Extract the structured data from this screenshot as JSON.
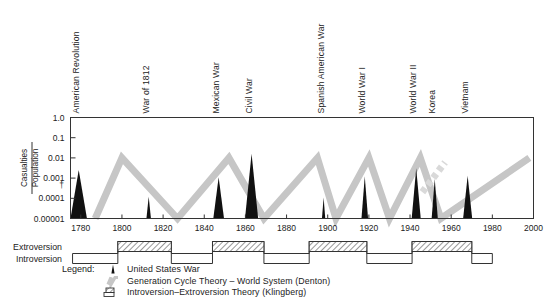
{
  "chart_data": {
    "type": "line",
    "title": "",
    "xlabel": "",
    "ylabel": "Casualties / Population",
    "ylabel_numerator": "Casualties",
    "ylabel_denominator": "Population",
    "xlim": [
      1775,
      2000
    ],
    "ylim": [
      1e-05,
      1.0
    ],
    "yscale": "log",
    "grid": false,
    "legend_position": "below-axes",
    "x_ticks": [
      1780,
      1800,
      1820,
      1840,
      1860,
      1880,
      1900,
      1920,
      1940,
      1960,
      1980,
      2000
    ],
    "x_tick_labels": [
      "1780",
      "1800",
      "1820",
      "1840",
      "1860",
      "1880",
      "1900",
      "1920",
      "1940",
      "1960",
      "1980",
      "2000"
    ],
    "y_ticks": [
      1.0,
      0.1,
      0.01,
      0.001,
      0.0001,
      1e-05
    ],
    "y_tick_labels": [
      "1.0",
      "0.1",
      "0.01",
      "0.001",
      "0.0001",
      "0.00001"
    ],
    "series": [
      {
        "name": "United States War",
        "style": "black-spike",
        "color": "#111111",
        "points": [
          {
            "label": "American Revolution",
            "year": 1779,
            "peak": 0.0025,
            "half_width": 4.0
          },
          {
            "label": "War of 1812",
            "year": 1813,
            "peak": 0.00012,
            "half_width": 1.1
          },
          {
            "label": "Mexican War",
            "year": 1847,
            "peak": 0.0011,
            "half_width": 2.6
          },
          {
            "label": "Civil War",
            "year": 1863,
            "peak": 0.016,
            "half_width": 3.2
          },
          {
            "label": "Spanish American War",
            "year": 1898,
            "peak": 0.00011,
            "half_width": 0.8
          },
          {
            "label": "World War I",
            "year": 1918,
            "peak": 0.0012,
            "half_width": 1.6
          },
          {
            "label": "World War II",
            "year": 1943,
            "peak": 0.0031,
            "half_width": 2.2
          },
          {
            "label": "Korea",
            "year": 1952,
            "peak": 0.0009,
            "half_width": 1.5
          },
          {
            "label": "Vietnam",
            "year": 1968,
            "peak": 0.0013,
            "half_width": 2.2
          }
        ]
      },
      {
        "name": "Generation Cycle Theory - World System (Denton)",
        "style": "gray-sawtooth",
        "color": "#c6c6c6",
        "cycle_peaks": [
          1800,
          1852,
          1895,
          1920,
          1945,
          1995
        ],
        "cycle_troughs": [
          1800,
          1827,
          1869,
          1904,
          1930,
          1955
        ]
      }
    ],
    "war_labels": [
      "American Revolution",
      "War of 1812",
      "Mexican War",
      "Civil War",
      "Spanish American War",
      "World War I",
      "World War II",
      "Korea",
      "Vietnam"
    ],
    "phase_band": {
      "rows": [
        "Extroversion",
        "Introversion"
      ],
      "extroversion_intervals": [
        [
          1798,
          1824
        ],
        [
          1844,
          1869
        ],
        [
          1891,
          1919
        ],
        [
          1941,
          1970
        ]
      ],
      "hatch": "diagonal"
    }
  },
  "axis": {
    "y_title_numerator": "Casualties",
    "y_title_denominator": "Population",
    "y_tick_labels": [
      "1.0",
      "0.1",
      "0.01",
      "0.001",
      "0.0001",
      "0.00001"
    ],
    "x_tick_labels": [
      "1780",
      "1800",
      "1820",
      "1840",
      "1860",
      "1880",
      "1900",
      "1920",
      "1940",
      "1960",
      "1980",
      "2000"
    ]
  },
  "war_labels": [
    {
      "text": "American Revolution",
      "year": 1779
    },
    {
      "text": "War of 1812",
      "year": 1813
    },
    {
      "text": "Mexican War",
      "year": 1847
    },
    {
      "text": "Civil War",
      "year": 1863
    },
    {
      "text": "Spanish American War",
      "year": 1898
    },
    {
      "text": "World War I",
      "year": 1918
    },
    {
      "text": "World War II",
      "year": 1943
    },
    {
      "text": "Korea",
      "year": 1952
    },
    {
      "text": "Vietnam",
      "year": 1968
    }
  ],
  "phase": {
    "extroversion_label": "Extroversion",
    "introversion_label": "Introversion"
  },
  "legend": {
    "title": "Legend:",
    "items": [
      {
        "symbol": "black-spike",
        "text": "United States War"
      },
      {
        "symbol": "gray-sawtooth",
        "text": "Generation Cycle Theory – World System (Denton)"
      },
      {
        "symbol": "hatched-box",
        "text": "Introversion–Extroversion Theory (Klingberg)"
      }
    ]
  },
  "colors": {
    "sawtooth": "#c6c6c6",
    "war_spike": "#111111",
    "axis": "#222222",
    "background": "#ffffff"
  }
}
